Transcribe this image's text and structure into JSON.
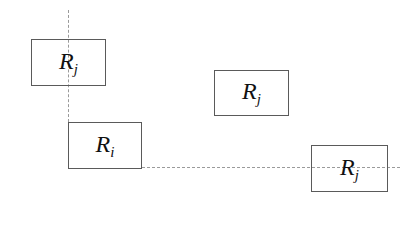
{
  "diagram": {
    "axes": {
      "vertical": {
        "x": 68,
        "y_start": 10,
        "y_end": 122,
        "style": "dashed"
      },
      "horizontal": {
        "y": 167,
        "x_start": 142,
        "x_end": 400,
        "style": "dashed"
      }
    },
    "boxes": [
      {
        "id": "box-rj-top-left",
        "base": "R",
        "sub": "j",
        "left": 31,
        "top": 39,
        "width": 75,
        "height": 47
      },
      {
        "id": "box-rj-middle",
        "base": "R",
        "sub": "j",
        "left": 214,
        "top": 70,
        "width": 75,
        "height": 46
      },
      {
        "id": "box-ri",
        "base": "R",
        "sub": "i",
        "left": 68,
        "top": 122,
        "width": 74,
        "height": 47
      },
      {
        "id": "box-rj-bottom-right",
        "base": "R",
        "sub": "j",
        "left": 311,
        "top": 145,
        "width": 77,
        "height": 47
      }
    ],
    "colors": {
      "box_border": "#5a5a5a",
      "axis_line": "#9a9a9a",
      "text": "#111111"
    }
  }
}
